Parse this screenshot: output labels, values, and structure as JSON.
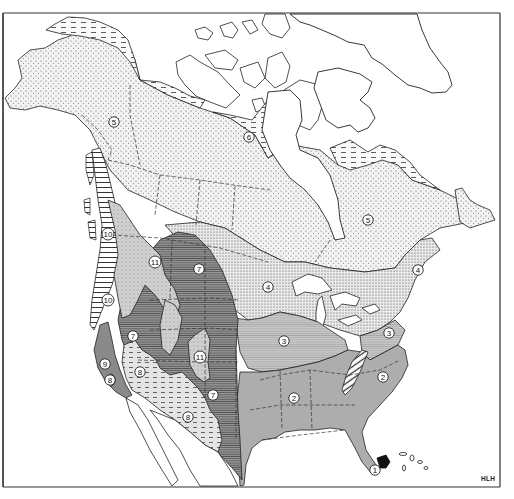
{
  "figure": {
    "type": "map",
    "credit": "HLH",
    "frame": {
      "top": 13,
      "bottom": 487,
      "left": 3,
      "right": 500
    }
  },
  "legend_patterns": {
    "1": "solid black",
    "2": "medium gray, fine vertical hatch",
    "3": "light gray, fine horizontal hatch",
    "4": "dense dot stipple",
    "5": "sparse dot stipple",
    "6": "dashed horizontal lines",
    "7": "dark gray, horizontal lines",
    "8": "light gray, dashes",
    "9": "dark gray solid",
    "10": "wide horizontal stripes",
    "11": "light gray, dots"
  },
  "zones": [
    {
      "id": "1",
      "label": "1",
      "x": 375,
      "y": 470,
      "region": "South Florida tip"
    },
    {
      "id": "2a",
      "label": "2",
      "x": 294,
      "y": 398,
      "region": "Southeastern US"
    },
    {
      "id": "2b",
      "label": "2",
      "x": 383,
      "y": 377,
      "region": "Carolinas"
    },
    {
      "id": "3a",
      "label": "3",
      "x": 284,
      "y": 341,
      "region": "Midwestern US"
    },
    {
      "id": "3b",
      "label": "3",
      "x": 389,
      "y": 333,
      "region": "Mid-Atlantic"
    },
    {
      "id": "4a",
      "label": "4",
      "x": 268,
      "y": 287,
      "region": "Ontario / northern Great Plains"
    },
    {
      "id": "4b",
      "label": "4",
      "x": 418,
      "y": 270,
      "region": "New England / Maritimes"
    },
    {
      "id": "5a",
      "label": "5",
      "x": 114,
      "y": 122,
      "region": "Alaska / Yukon"
    },
    {
      "id": "5b",
      "label": "5",
      "x": 368,
      "y": 220,
      "region": "Quebec / Labrador"
    },
    {
      "id": "6",
      "label": "6",
      "x": 249,
      "y": 137,
      "region": "Arctic Canada"
    },
    {
      "id": "7a",
      "label": "7",
      "x": 199,
      "y": 269,
      "region": "Great Plains north"
    },
    {
      "id": "7b",
      "label": "7",
      "x": 133,
      "y": 336,
      "region": "Great Basin"
    },
    {
      "id": "7c",
      "label": "7",
      "x": 213,
      "y": 395,
      "region": "Southern Plains"
    },
    {
      "id": "8a",
      "label": "8",
      "x": 140,
      "y": 372,
      "region": "Mojave / Sonoran"
    },
    {
      "id": "8b",
      "label": "8",
      "x": 188,
      "y": 417,
      "region": "Chihuahuan"
    },
    {
      "id": "8c",
      "label": "8",
      "x": 110,
      "y": 380,
      "region": "Central Valley oval"
    },
    {
      "id": "9",
      "label": "9",
      "x": 105,
      "y": 364,
      "region": "California coast"
    },
    {
      "id": "10a",
      "label": "10",
      "x": 108,
      "y": 234,
      "region": "Pacific Northwest coast north"
    },
    {
      "id": "10b",
      "label": "10",
      "x": 108,
      "y": 300,
      "region": "Pacific Northwest coast south"
    },
    {
      "id": "11a",
      "label": "11",
      "x": 155,
      "y": 262,
      "region": "Northern Rockies"
    },
    {
      "id": "11b",
      "label": "11",
      "x": 200,
      "y": 357,
      "region": "Southern Rockies"
    }
  ]
}
